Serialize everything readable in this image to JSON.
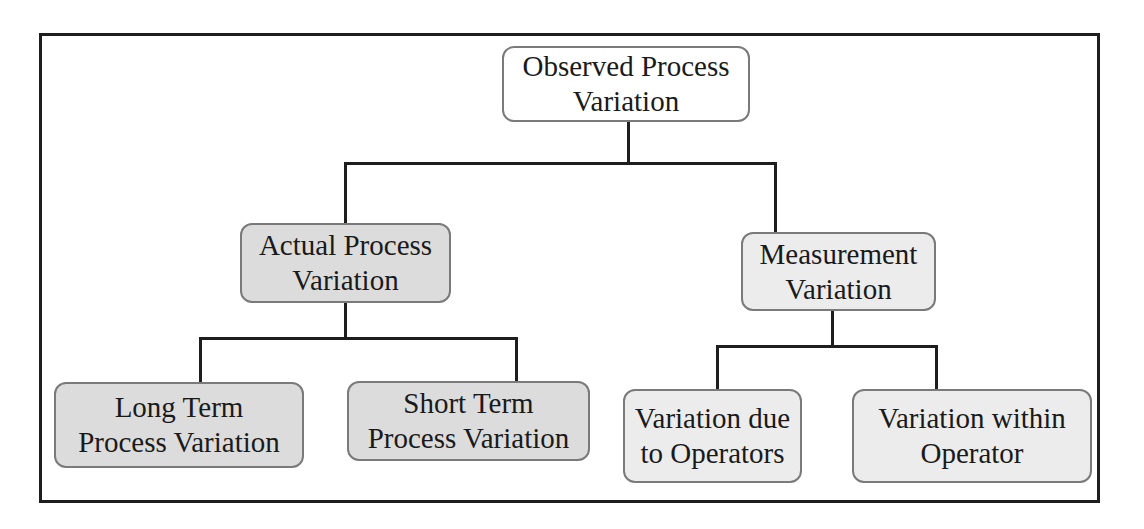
{
  "diagram": {
    "type": "hierarchy-tree",
    "colors": {
      "frame": "#1e1e1e",
      "connector": "#1e1e1e",
      "node_border": "#7a7a7a",
      "root_fill": "#ffffff",
      "actual_fill": "#dcdcdc",
      "measurement_fill": "#ececec",
      "text": "#1a1a1a"
    },
    "root": {
      "id": "observed",
      "label": "Observed Process\nVariation"
    },
    "level1": [
      {
        "id": "actual",
        "label": "Actual Process\nVariation",
        "parent": "observed"
      },
      {
        "id": "measurement",
        "label": "Measurement\nVariation",
        "parent": "observed"
      }
    ],
    "level2": [
      {
        "id": "long-term",
        "label": "Long Term\nProcess Variation",
        "parent": "actual"
      },
      {
        "id": "short-term",
        "label": "Short Term\nProcess Variation",
        "parent": "actual"
      },
      {
        "id": "operators",
        "label": "Variation due\nto Operators",
        "parent": "measurement"
      },
      {
        "id": "within-operator",
        "label": "Variation within\nOperator",
        "parent": "measurement"
      }
    ]
  }
}
